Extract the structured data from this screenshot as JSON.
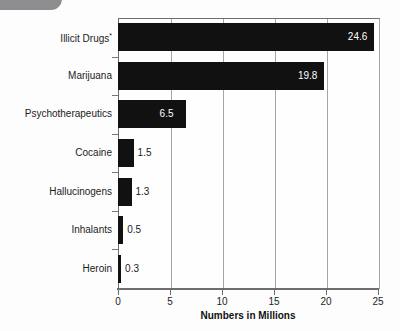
{
  "chart_data": {
    "type": "bar",
    "orientation": "horizontal",
    "title": "",
    "xlabel": "Numbers in Millions",
    "ylabel": "",
    "categories": [
      "Illicit Drugs*",
      "Marijuana",
      "Psychotherapeutics",
      "Cocaine",
      "Hallucinogens",
      "Inhalants",
      "Heroin"
    ],
    "values": [
      24.6,
      19.8,
      6.5,
      1.5,
      1.3,
      0.5,
      0.3
    ],
    "value_labels": [
      "24.6",
      "19.8",
      "6.5",
      "1.5",
      "1.3",
      "0.5",
      "0.3"
    ],
    "label_placement": [
      "inside",
      "inside",
      "inside",
      "outside",
      "outside",
      "outside",
      "outside"
    ],
    "xlim": [
      0,
      25
    ],
    "xticks": [
      0,
      5,
      10,
      15,
      20,
      25
    ],
    "xtick_labels": [
      "0",
      "5",
      "10",
      "15",
      "20",
      "25"
    ],
    "grid": "vertical",
    "legend": "none",
    "bar_color": "#111111",
    "grid_color": "#a6a6a6",
    "axis_color": "#6e6e6e",
    "background_color": "#fefefe",
    "footnote_marker": "*"
  }
}
